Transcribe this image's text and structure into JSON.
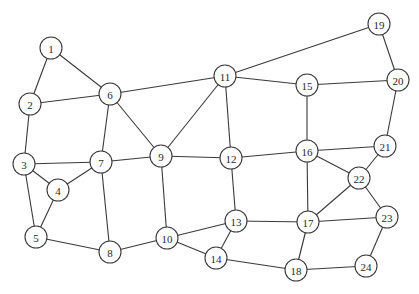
{
  "diagram": {
    "type": "undirected-graph",
    "node_radius": 11,
    "colors": {
      "stroke": "#3a3a3a",
      "fill": "#ffffff",
      "text": "#2a2a2a",
      "background": "#ffffff"
    },
    "nodes": [
      {
        "id": "1",
        "label": "1",
        "x": 51,
        "y": 48
      },
      {
        "id": "2",
        "label": "2",
        "x": 30,
        "y": 104
      },
      {
        "id": "3",
        "label": "3",
        "x": 24,
        "y": 164
      },
      {
        "id": "4",
        "label": "4",
        "x": 58,
        "y": 190
      },
      {
        "id": "5",
        "label": "5",
        "x": 36,
        "y": 237
      },
      {
        "id": "6",
        "label": "6",
        "x": 110,
        "y": 94
      },
      {
        "id": "7",
        "label": "7",
        "x": 101,
        "y": 162
      },
      {
        "id": "8",
        "label": "8",
        "x": 110,
        "y": 252
      },
      {
        "id": "9",
        "label": "9",
        "x": 161,
        "y": 156
      },
      {
        "id": "10",
        "label": "10",
        "x": 167,
        "y": 238
      },
      {
        "id": "11",
        "label": "11",
        "x": 225,
        "y": 76
      },
      {
        "id": "12",
        "label": "12",
        "x": 231,
        "y": 158
      },
      {
        "id": "13",
        "label": "13",
        "x": 236,
        "y": 221
      },
      {
        "id": "14",
        "label": "14",
        "x": 216,
        "y": 258
      },
      {
        "id": "15",
        "label": "15",
        "x": 307,
        "y": 85
      },
      {
        "id": "16",
        "label": "16",
        "x": 307,
        "y": 151
      },
      {
        "id": "17",
        "label": "17",
        "x": 308,
        "y": 222
      },
      {
        "id": "18",
        "label": "18",
        "x": 296,
        "y": 270
      },
      {
        "id": "19",
        "label": "19",
        "x": 379,
        "y": 24
      },
      {
        "id": "20",
        "label": "20",
        "x": 398,
        "y": 80
      },
      {
        "id": "21",
        "label": "21",
        "x": 385,
        "y": 146
      },
      {
        "id": "22",
        "label": "22",
        "x": 359,
        "y": 178
      },
      {
        "id": "23",
        "label": "23",
        "x": 387,
        "y": 217
      },
      {
        "id": "24",
        "label": "24",
        "x": 366,
        "y": 266
      }
    ],
    "edges": [
      [
        "1",
        "2"
      ],
      [
        "1",
        "6"
      ],
      [
        "2",
        "6"
      ],
      [
        "2",
        "3"
      ],
      [
        "3",
        "7"
      ],
      [
        "3",
        "4"
      ],
      [
        "3",
        "5"
      ],
      [
        "4",
        "7"
      ],
      [
        "4",
        "5"
      ],
      [
        "5",
        "8"
      ],
      [
        "6",
        "7"
      ],
      [
        "6",
        "9"
      ],
      [
        "6",
        "11"
      ],
      [
        "7",
        "8"
      ],
      [
        "7",
        "9"
      ],
      [
        "8",
        "10"
      ],
      [
        "9",
        "11"
      ],
      [
        "9",
        "12"
      ],
      [
        "9",
        "10"
      ],
      [
        "10",
        "13"
      ],
      [
        "10",
        "14"
      ],
      [
        "11",
        "19"
      ],
      [
        "11",
        "15"
      ],
      [
        "11",
        "12"
      ],
      [
        "12",
        "16"
      ],
      [
        "12",
        "13"
      ],
      [
        "13",
        "14"
      ],
      [
        "13",
        "17"
      ],
      [
        "14",
        "18"
      ],
      [
        "15",
        "20"
      ],
      [
        "15",
        "16"
      ],
      [
        "16",
        "21"
      ],
      [
        "16",
        "22"
      ],
      [
        "16",
        "17"
      ],
      [
        "17",
        "22"
      ],
      [
        "17",
        "23"
      ],
      [
        "17",
        "18"
      ],
      [
        "18",
        "24"
      ],
      [
        "19",
        "20"
      ],
      [
        "20",
        "21"
      ],
      [
        "21",
        "22"
      ],
      [
        "22",
        "23"
      ],
      [
        "23",
        "24"
      ]
    ]
  }
}
